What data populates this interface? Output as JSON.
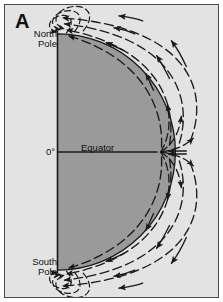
{
  "figure": {
    "panel_letter": "A",
    "type": "diagram",
    "colors": {
      "background": "#e3e3e3",
      "body_fill": "#9a9a9a",
      "line": "#1a1a1a",
      "frame_border": "#4a4a4a",
      "text": "#111111"
    }
  },
  "labels": {
    "north_pole": "North\nPole",
    "south_pole": "South\nPole",
    "zero_degree": "0°",
    "equator": "Equator"
  },
  "geometry": {
    "axis_x": 57,
    "north_pole_y": 33,
    "south_pole_y": 271,
    "equator_y": 152,
    "body_right_x": 158,
    "body_radius": 119
  },
  "field_lines": {
    "description": "Dashed arcs sweeping from the equator outward and around to each pole, arrowheads pointing poleward, with tight nested loops converging at the North and South Poles.",
    "arrow_direction_top": "poleward-left",
    "arrow_direction_bottom": "poleward-left",
    "arrow_direction_equator": "outward"
  }
}
